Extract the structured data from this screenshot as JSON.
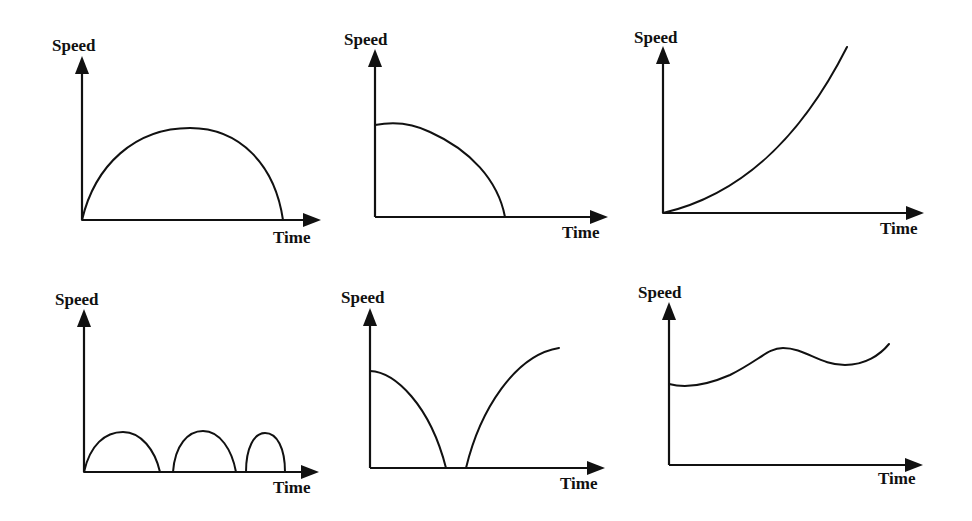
{
  "figure": {
    "ink_color": "#111111",
    "background": "#ffffff"
  },
  "graphs": [
    {
      "id": "graph-1",
      "y_label": "Speed",
      "x_label": "Time",
      "shape": "Single arch: speed rises from zero to a maximum then falls back to zero",
      "origin": [
        82,
        220
      ],
      "y_axis_tip": [
        82,
        56
      ],
      "x_axis_tip": [
        321,
        220
      ],
      "y_label_pos": [
        52,
        51
      ],
      "x_label_pos": [
        273,
        243
      ],
      "curves": [
        "M82,220 C95,165 135,128 190,128 C240,128 275,165 283,220"
      ]
    },
    {
      "id": "graph-2",
      "y_label": "Speed",
      "x_label": "Time",
      "shape": "Starts at a non-zero speed, stays briefly level then decreases at an increasing rate to zero",
      "origin": [
        375,
        217
      ],
      "y_axis_tip": [
        375,
        49
      ],
      "x_axis_tip": [
        608,
        217
      ],
      "y_label_pos": [
        344,
        45
      ],
      "x_label_pos": [
        562,
        238
      ],
      "curves": [
        "M375,125 C390,122 410,122 430,132 C470,150 498,180 505,217"
      ]
    },
    {
      "id": "graph-3",
      "y_label": "Speed",
      "x_label": "Time",
      "shape": "Starts at zero and increases at an increasing rate (concave up)",
      "origin": [
        663,
        213
      ],
      "y_axis_tip": [
        663,
        46
      ],
      "x_axis_tip": [
        924,
        213
      ],
      "y_label_pos": [
        634,
        43
      ],
      "x_label_pos": [
        880,
        234
      ],
      "curves": [
        "M663,213 C740,195 800,140 847,47"
      ]
    },
    {
      "id": "graph-4",
      "y_label": "Speed",
      "x_label": "Time",
      "shape": "Three successive arches, each returning to zero (bouncing)",
      "origin": [
        84,
        472
      ],
      "y_axis_tip": [
        84,
        309
      ],
      "x_axis_tip": [
        319,
        472
      ],
      "y_label_pos": [
        55,
        305
      ],
      "x_label_pos": [
        273,
        493
      ],
      "curves": [
        "M84,472 C90,445 105,432 123,432 C141,432 155,450 160,472",
        "M173,472 C175,445 188,431 203,431 C220,431 232,450 236,472",
        "M246,472 C246,448 254,433 265,433 C277,433 285,448 285,472"
      ]
    },
    {
      "id": "graph-5",
      "y_label": "Speed",
      "x_label": "Time",
      "shape": "Decreases from a non-zero speed to zero, remains at zero briefly, then increases again",
      "origin": [
        370,
        468
      ],
      "y_axis_tip": [
        370,
        308
      ],
      "x_axis_tip": [
        605,
        468
      ],
      "y_label_pos": [
        341,
        303
      ],
      "x_label_pos": [
        560,
        489
      ],
      "curves": [
        "M370,371 C395,372 430,405 446,468",
        "M466,468 C480,410 515,355 559,348"
      ]
    },
    {
      "id": "graph-6",
      "y_label": "Speed",
      "x_label": "Time",
      "shape": "Starts at a non-zero speed and varies in a wave, never reaching zero",
      "origin": [
        669,
        465
      ],
      "y_axis_tip": [
        669,
        302
      ],
      "x_axis_tip": [
        923,
        465
      ],
      "y_label_pos": [
        638,
        298
      ],
      "x_label_pos": [
        878,
        484
      ],
      "curves": [
        "M669,384 C680,387 700,388 730,375 C760,360 768,348 783,348 C805,348 820,365 845,365 C865,365 880,355 889,344"
      ]
    }
  ]
}
